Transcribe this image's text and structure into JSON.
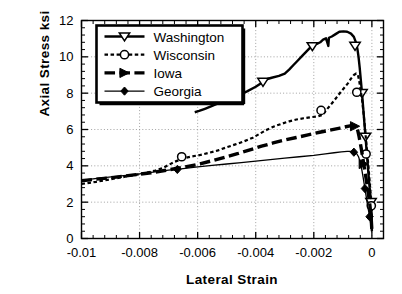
{
  "chart_data": {
    "type": "line",
    "title": "",
    "xlabel": "Lateral  Strain",
    "ylabel": "Axial  Stress  ksi",
    "xlim": [
      -0.01,
      0.0004
    ],
    "ylim": [
      0,
      12
    ],
    "xticks": [
      "-0.01",
      "-0.008",
      "-0.006",
      "-0.004",
      "-0.002",
      "0"
    ],
    "xtick_values": [
      -0.01,
      -0.008,
      -0.006,
      -0.004,
      -0.002,
      0
    ],
    "yticks": [
      "0",
      "2",
      "4",
      "6",
      "8",
      "10",
      "12"
    ],
    "ytick_values": [
      0,
      2,
      4,
      6,
      8,
      10,
      12
    ],
    "grid": "dotted-both",
    "minor_ticks": "x:4 per major, y:4 per major",
    "legend_position": "upper-left-inside",
    "series": [
      {
        "name": "Washington",
        "style": "solid",
        "marker": "triangle-down-open",
        "linewidth": 2.4,
        "color": "#000000",
        "points": [
          [
            -0.0061,
            6.95
          ],
          [
            -0.00595,
            7.02
          ],
          [
            -0.00575,
            7.14
          ],
          [
            -0.0055,
            7.3
          ],
          [
            -0.0052,
            7.5
          ],
          [
            -0.0049,
            7.7
          ],
          [
            -0.0046,
            7.88
          ],
          [
            -0.0043,
            8.1
          ],
          [
            -0.004,
            8.35
          ],
          [
            -0.00375,
            8.62
          ],
          [
            -0.0036,
            8.78
          ],
          [
            -0.00345,
            8.85
          ],
          [
            -0.0032,
            8.95
          ],
          [
            -0.003,
            9.08
          ],
          [
            -0.00285,
            9.3
          ],
          [
            -0.0027,
            9.55
          ],
          [
            -0.00255,
            9.8
          ],
          [
            -0.0024,
            10.05
          ],
          [
            -0.00225,
            10.3
          ],
          [
            -0.0021,
            10.55
          ],
          [
            -0.00198,
            10.72
          ],
          [
            -0.00188,
            10.72
          ],
          [
            -0.00178,
            10.8
          ],
          [
            -0.00168,
            10.95
          ],
          [
            -0.00158,
            11.02
          ],
          [
            -0.0015,
            10.6
          ],
          [
            -0.00148,
            11.05
          ],
          [
            -0.00138,
            11.12
          ],
          [
            -0.00125,
            11.25
          ],
          [
            -0.00112,
            11.38
          ],
          [
            -0.00098,
            11.4
          ],
          [
            -0.00085,
            11.38
          ],
          [
            -0.00072,
            11.28
          ],
          [
            -0.00062,
            11.1
          ],
          [
            -0.00055,
            10.8
          ],
          [
            -0.0005,
            10.45
          ],
          [
            -0.00046,
            10.0
          ],
          [
            -0.00042,
            9.4
          ],
          [
            -0.00038,
            8.7
          ],
          [
            -0.00034,
            8.0
          ],
          [
            -0.0003,
            7.2
          ],
          [
            -0.00026,
            6.4
          ],
          [
            -0.00022,
            5.6
          ],
          [
            -0.00018,
            4.8
          ],
          [
            -0.00014,
            4.0
          ],
          [
            -0.0001,
            3.2
          ],
          [
            -6e-05,
            2.5
          ],
          [
            -3e-05,
            2.0
          ],
          [
            -1e-05,
            1.2
          ],
          [
            0.0,
            0.4
          ]
        ],
        "marker_points": [
          [
            -0.00375,
            8.62
          ],
          [
            -0.00205,
            10.58
          ],
          [
            -0.00058,
            10.6
          ],
          [
            -0.00034,
            8.0
          ],
          [
            -0.00022,
            5.6
          ],
          [
            -3e-05,
            2.0
          ]
        ]
      },
      {
        "name": "Wisconsin",
        "style": "dashed",
        "marker": "circle-open",
        "linewidth": 2.2,
        "color": "#000000",
        "points": [
          [
            -0.01,
            3.0
          ],
          [
            -0.0095,
            3.12
          ],
          [
            -0.009,
            3.26
          ],
          [
            -0.0085,
            3.4
          ],
          [
            -0.008,
            3.54
          ],
          [
            -0.0075,
            3.72
          ],
          [
            -0.0072,
            3.88
          ],
          [
            -0.007,
            4.05
          ],
          [
            -0.0068,
            4.22
          ],
          [
            -0.0066,
            4.34
          ],
          [
            -0.0064,
            4.45
          ],
          [
            -0.0062,
            4.52
          ],
          [
            -0.0059,
            4.6
          ],
          [
            -0.0056,
            4.72
          ],
          [
            -0.0053,
            4.85
          ],
          [
            -0.005,
            5.02
          ],
          [
            -0.0047,
            5.18
          ],
          [
            -0.0044,
            5.35
          ],
          [
            -0.0041,
            5.55
          ],
          [
            -0.00385,
            5.78
          ],
          [
            -0.0036,
            6.0
          ],
          [
            -0.00335,
            6.18
          ],
          [
            -0.0031,
            6.32
          ],
          [
            -0.00285,
            6.45
          ],
          [
            -0.0026,
            6.55
          ],
          [
            -0.00235,
            6.62
          ],
          [
            -0.0021,
            6.68
          ],
          [
            -0.00185,
            6.72
          ],
          [
            -0.00168,
            6.82
          ],
          [
            -0.00158,
            7.05
          ],
          [
            -0.00145,
            7.3
          ],
          [
            -0.00132,
            7.55
          ],
          [
            -0.0012,
            7.8
          ],
          [
            -0.00108,
            8.05
          ],
          [
            -0.00095,
            8.3
          ],
          [
            -0.00082,
            8.55
          ],
          [
            -0.00072,
            8.8
          ],
          [
            -0.00062,
            9.0
          ],
          [
            -0.00054,
            9.08
          ],
          [
            -0.00048,
            9.0
          ],
          [
            -0.00044,
            8.7
          ],
          [
            -0.0004,
            8.3
          ],
          [
            -0.00036,
            7.9
          ],
          [
            -0.00032,
            7.4
          ],
          [
            -0.00028,
            6.8
          ],
          [
            -0.00024,
            6.1
          ],
          [
            -0.0002,
            5.4
          ],
          [
            -0.00016,
            4.7
          ],
          [
            -0.00012,
            4.0
          ],
          [
            -9e-05,
            3.4
          ],
          [
            -6e-05,
            2.8
          ],
          [
            -4e-05,
            2.3
          ],
          [
            -2e-05,
            1.85
          ],
          [
            0.0,
            1.2
          ]
        ],
        "marker_points": [
          [
            -0.00655,
            4.5
          ],
          [
            -0.00175,
            7.05
          ],
          [
            -0.00052,
            8.05
          ],
          [
            -0.0002,
            4.65
          ],
          [
            -2e-05,
            1.8
          ]
        ]
      },
      {
        "name": "Iowa",
        "style": "long-dash",
        "marker": "triangle-right-filled",
        "linewidth": 3.4,
        "color": "#000000",
        "points": [
          [
            -0.01,
            3.18
          ],
          [
            -0.0094,
            3.28
          ],
          [
            -0.0088,
            3.38
          ],
          [
            -0.0082,
            3.5
          ],
          [
            -0.0076,
            3.62
          ],
          [
            -0.007,
            3.78
          ],
          [
            -0.0065,
            3.92
          ],
          [
            -0.006,
            4.08
          ],
          [
            -0.0055,
            4.28
          ],
          [
            -0.005,
            4.5
          ],
          [
            -0.0046,
            4.68
          ],
          [
            -0.0042,
            4.88
          ],
          [
            -0.0038,
            5.08
          ],
          [
            -0.0034,
            5.26
          ],
          [
            -0.003,
            5.42
          ],
          [
            -0.0026,
            5.56
          ],
          [
            -0.0022,
            5.7
          ],
          [
            -0.0018,
            5.85
          ],
          [
            -0.0014,
            5.98
          ],
          [
            -0.0011,
            6.08
          ],
          [
            -0.0009,
            6.15
          ],
          [
            -0.00075,
            6.2
          ],
          [
            -0.00065,
            6.22
          ],
          [
            -0.00058,
            6.2
          ],
          [
            -0.00052,
            6.1
          ],
          [
            -0.00048,
            5.9
          ],
          [
            -0.00044,
            5.6
          ],
          [
            -0.0004,
            5.25
          ],
          [
            -0.00036,
            4.9
          ],
          [
            -0.00032,
            4.5
          ],
          [
            -0.00028,
            4.1
          ],
          [
            -0.00024,
            3.7
          ],
          [
            -0.0002,
            3.3
          ],
          [
            -0.00016,
            2.9
          ],
          [
            -0.00012,
            2.45
          ],
          [
            -8e-05,
            2.0
          ],
          [
            -5e-05,
            1.55
          ],
          [
            -2e-05,
            1.0
          ],
          [
            0.0,
            0.45
          ]
        ],
        "marker_points": [
          [
            -0.00058,
            6.18
          ],
          [
            -0.00028,
            4.1
          ]
        ]
      },
      {
        "name": "Georgia",
        "style": "solid",
        "marker": "diamond-filled",
        "linewidth": 1.3,
        "color": "#000000",
        "points": [
          [
            -0.01,
            3.2
          ],
          [
            -0.0094,
            3.32
          ],
          [
            -0.0088,
            3.42
          ],
          [
            -0.0082,
            3.52
          ],
          [
            -0.0076,
            3.64
          ],
          [
            -0.007,
            3.76
          ],
          [
            -0.0065,
            3.85
          ],
          [
            -0.006,
            3.94
          ],
          [
            -0.0055,
            4.02
          ],
          [
            -0.005,
            4.1
          ],
          [
            -0.0045,
            4.18
          ],
          [
            -0.004,
            4.26
          ],
          [
            -0.0035,
            4.34
          ],
          [
            -0.003,
            4.42
          ],
          [
            -0.0025,
            4.5
          ],
          [
            -0.002,
            4.58
          ],
          [
            -0.0016,
            4.66
          ],
          [
            -0.0013,
            4.72
          ],
          [
            -0.00105,
            4.77
          ],
          [
            -0.00085,
            4.8
          ],
          [
            -0.0007,
            4.8
          ],
          [
            -0.0006,
            4.76
          ],
          [
            -0.00052,
            4.66
          ],
          [
            -0.00046,
            4.5
          ],
          [
            -0.00042,
            4.3
          ],
          [
            -0.00038,
            4.05
          ],
          [
            -0.00034,
            3.72
          ],
          [
            -0.0003,
            3.35
          ],
          [
            -0.00026,
            2.95
          ],
          [
            -0.00022,
            2.55
          ],
          [
            -0.00018,
            2.15
          ],
          [
            -0.00014,
            1.75
          ],
          [
            -0.0001,
            1.4
          ],
          [
            -6e-05,
            1.05
          ],
          [
            -3e-05,
            0.7
          ],
          [
            0.0,
            0.35
          ]
        ],
        "marker_points": [
          [
            -0.0067,
            3.8
          ],
          [
            -0.00062,
            4.75
          ],
          [
            -0.00024,
            2.75
          ],
          [
            -8e-05,
            1.2
          ]
        ]
      }
    ]
  },
  "legend": {
    "entries": [
      {
        "label": "Washington"
      },
      {
        "label": "Wisconsin"
      },
      {
        "label": "Iowa"
      },
      {
        "label": "Georgia"
      }
    ]
  },
  "axes": {
    "x_title": "Lateral  Strain",
    "y_title": "Axial  Stress  ksi"
  }
}
